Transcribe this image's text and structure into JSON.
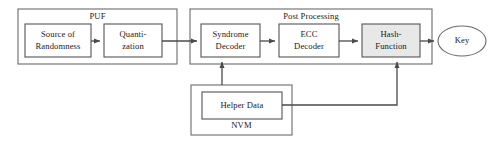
{
  "diagram": {
    "colors": {
      "border": "#6b6b6b",
      "inner_border": "#555555",
      "fill_white": "#ffffff",
      "fill_gray": "#e8e8e8",
      "line": "#4a4a4a",
      "text": "#1a1a1a",
      "shadow": "#b8b8b8",
      "background": "#ffffff"
    },
    "groups": [
      {
        "id": "puf",
        "label": "PUF",
        "x": 18,
        "y": 9,
        "w": 159,
        "h": 55
      },
      {
        "id": "post-processing",
        "label": "Post Processing",
        "x": 190,
        "y": 9,
        "w": 242,
        "h": 55
      },
      {
        "id": "nvm",
        "label": "NVM",
        "x": 191,
        "y": 85,
        "w": 101,
        "h": 50
      }
    ],
    "blocks": [
      {
        "id": "source-of-randomness",
        "label": "Source of\nRandomness",
        "x": 25,
        "y": 24,
        "w": 66,
        "h": 33,
        "fill": "#ffffff"
      },
      {
        "id": "quantization",
        "label": "Quanti-\nzation",
        "x": 104,
        "y": 24,
        "w": 58,
        "h": 33,
        "fill": "#ffffff"
      },
      {
        "id": "syndrome-decoder",
        "label": "Syndrome\nDecoder",
        "x": 201,
        "y": 24,
        "w": 59,
        "h": 33,
        "fill": "#ffffff"
      },
      {
        "id": "ecc-decoder",
        "label": "ECC\nDecoder",
        "x": 279,
        "y": 24,
        "w": 60,
        "h": 33,
        "fill": "#ffffff"
      },
      {
        "id": "hash-function",
        "label": "Hash-\nFunction",
        "x": 362,
        "y": 24,
        "w": 58,
        "h": 33,
        "fill": "#e8e8e8"
      },
      {
        "id": "helper-data",
        "label": "Helper Data",
        "x": 202,
        "y": 92,
        "w": 80,
        "h": 27,
        "fill": "#ffffff"
      }
    ],
    "terminals": [
      {
        "id": "key",
        "label": "Key",
        "cx": 462,
        "cy": 41,
        "rx": 24,
        "ry": 15,
        "fill": "#ffffff"
      }
    ],
    "connections": [
      {
        "id": "source-to-quantization",
        "from": "source-of-randomness",
        "to": "quantization",
        "path": "M 91 41 L 101 41",
        "arrow": true
      },
      {
        "id": "quantization-to-syndrome-decoder",
        "from": "quantization",
        "to": "syndrome-decoder",
        "path": "M 162 41 L 198 41",
        "arrow": true
      },
      {
        "id": "syndrome-decoder-to-ecc-decoder",
        "from": "syndrome-decoder",
        "to": "ecc-decoder",
        "path": "M 260 41 L 276 41",
        "arrow": true
      },
      {
        "id": "ecc-decoder-to-hash-function",
        "from": "ecc-decoder",
        "to": "hash-function",
        "path": "M 339 41 L 359 41",
        "arrow": true
      },
      {
        "id": "hash-function-to-key",
        "from": "hash-function",
        "to": "key",
        "path": "M 420 41 L 435 41",
        "arrow": true
      },
      {
        "id": "helper-data-to-syndrome-decoder",
        "from": "helper-data",
        "to": "syndrome-decoder",
        "path": "M 222 85 L 222 60",
        "arrow": true
      },
      {
        "id": "helper-data-to-hash-function",
        "from": "helper-data",
        "to": "hash-function",
        "path": "M 282 105 L 397 105 L 397 60",
        "arrow": true
      }
    ]
  }
}
